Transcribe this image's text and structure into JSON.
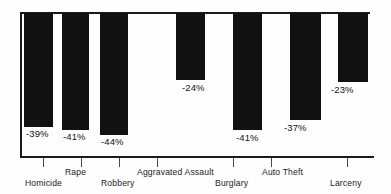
{
  "chart_data": {
    "type": "bar",
    "title": "",
    "subtitle": "",
    "xlabel": "",
    "ylabel": "",
    "orientation": "vertical-descending",
    "grid": false,
    "legend": false,
    "legend_position": "none",
    "ylim": [
      -50,
      0
    ],
    "categories": [
      "Homicide",
      "Rape",
      "Robbery",
      "Aggravated Assault",
      "Burglary",
      "Auto Theft",
      "Larceny"
    ],
    "values": [
      -39,
      -41,
      -44,
      -24,
      -41,
      -37,
      -23
    ],
    "data_labels": [
      "-39%",
      "-41%",
      "-44%",
      "-24%",
      "-41%",
      "-37%",
      "-23%"
    ],
    "tick_labels": [
      "Homicide",
      "Rape",
      "Robbery",
      "Aggravated Assault",
      "Burglary",
      "Auto Theft",
      "Larceny"
    ]
  },
  "style": {
    "bar_color": "#111111",
    "axis_color": "#1a1a1a",
    "text_color": "#1a1a1a",
    "background": "#fefefe"
  },
  "bars": [
    {
      "label": "Homicide",
      "value_text": "-39%",
      "x": 24,
      "width": 29,
      "bottom_y": 127,
      "label_x": 26,
      "label_y": 128,
      "tick_x": 43,
      "cat_x": 25,
      "cat_row": "low"
    },
    {
      "label": "Rape",
      "value_text": "-41%",
      "x": 62,
      "width": 27,
      "bottom_y": 130,
      "label_x": 63,
      "label_y": 131,
      "tick_x": 81,
      "cat_x": 65,
      "cat_row": "high"
    },
    {
      "label": "Robbery",
      "value_text": "-44%",
      "x": 100,
      "width": 28,
      "bottom_y": 135,
      "label_x": 101,
      "label_y": 136,
      "tick_x": 119,
      "cat_x": 101,
      "cat_row": "low"
    },
    {
      "label": "Aggravated Assault",
      "value_text": "-24%",
      "x": 176,
      "width": 29,
      "bottom_y": 80,
      "label_x": 182,
      "label_y": 82,
      "tick_x": 157,
      "cat_x": 137,
      "cat_row": "high"
    },
    {
      "label": "Burglary",
      "value_text": "-41%",
      "x": 233,
      "width": 29,
      "bottom_y": 130,
      "label_x": 236,
      "label_y": 132,
      "tick_x": 233,
      "cat_x": 215,
      "cat_row": "low"
    },
    {
      "label": "Auto Theft",
      "value_text": "-37%",
      "x": 290,
      "width": 31,
      "bottom_y": 120,
      "label_x": 284,
      "label_y": 122,
      "tick_x": 271,
      "cat_x": 262,
      "cat_row": "high"
    },
    {
      "label": "Larceny",
      "value_text": "-23%",
      "x": 338,
      "width": 30,
      "bottom_y": 82,
      "label_x": 331,
      "label_y": 84,
      "tick_x": 347,
      "cat_x": 330,
      "cat_row": "low"
    }
  ]
}
